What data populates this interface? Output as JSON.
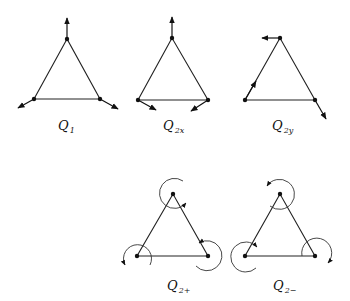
{
  "diagrams": [
    {
      "id": "q1",
      "label": "Q",
      "subscript": "1",
      "description": "Symmetric stretch mode: all vertices displaced radially outward"
    },
    {
      "id": "q2x",
      "label": "Q",
      "subscript": "2x",
      "description": "Degenerate mode x-component"
    },
    {
      "id": "q2y",
      "label": "Q",
      "subscript": "2y",
      "description": "Degenerate mode y-component"
    },
    {
      "id": "q2plus",
      "label": "Q",
      "subscript": "2+",
      "description": "Circular combination, counter-clockwise rotations"
    },
    {
      "id": "q2minus",
      "label": "Q",
      "subscript": "2−",
      "description": "Circular combination, clockwise rotations"
    }
  ],
  "colors": {
    "line": "#222222",
    "vertex": "#111111",
    "background": "#ffffff"
  }
}
